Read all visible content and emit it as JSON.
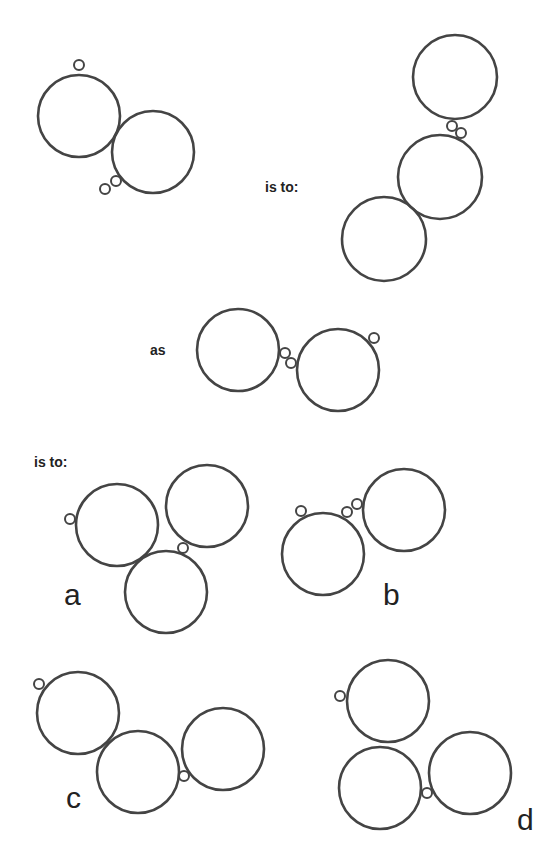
{
  "puzzle": {
    "stroke_color": "#444444",
    "background": "#ffffff",
    "labels": {
      "is_to_1": "is to:",
      "as": "as",
      "is_to_2": "is to:"
    },
    "figures": [
      {
        "id": "figure-1",
        "big": [
          {
            "cx": 79,
            "cy": 116,
            "r": 41
          },
          {
            "cx": 153,
            "cy": 152,
            "r": 41
          }
        ],
        "small": [
          {
            "cx": 79,
            "cy": 65,
            "r": 5
          },
          {
            "cx": 105,
            "cy": 189,
            "r": 5
          },
          {
            "cx": 116,
            "cy": 181,
            "r": 5
          }
        ]
      },
      {
        "id": "figure-2",
        "big": [
          {
            "cx": 455,
            "cy": 77,
            "r": 42
          },
          {
            "cx": 440,
            "cy": 177,
            "r": 42
          },
          {
            "cx": 384,
            "cy": 239,
            "r": 42
          }
        ],
        "small": [
          {
            "cx": 452,
            "cy": 126,
            "r": 5
          },
          {
            "cx": 461,
            "cy": 133,
            "r": 5
          }
        ]
      },
      {
        "id": "figure-3",
        "big": [
          {
            "cx": 238,
            "cy": 350,
            "r": 41
          },
          {
            "cx": 338,
            "cy": 370,
            "r": 41
          }
        ],
        "small": [
          {
            "cx": 285,
            "cy": 353,
            "r": 5
          },
          {
            "cx": 291,
            "cy": 363,
            "r": 5
          },
          {
            "cx": 374,
            "cy": 338,
            "r": 5
          }
        ]
      }
    ],
    "options": [
      {
        "label": "a",
        "label_pos": {
          "x": 64,
          "y": 605
        },
        "big": [
          {
            "cx": 117,
            "cy": 525,
            "r": 41
          },
          {
            "cx": 207,
            "cy": 506,
            "r": 41
          },
          {
            "cx": 166,
            "cy": 592,
            "r": 41
          }
        ],
        "small": [
          {
            "cx": 70,
            "cy": 519,
            "r": 5
          },
          {
            "cx": 183,
            "cy": 548,
            "r": 5
          }
        ]
      },
      {
        "label": "b",
        "label_pos": {
          "x": 383,
          "y": 605
        },
        "big": [
          {
            "cx": 323,
            "cy": 554,
            "r": 41
          },
          {
            "cx": 404,
            "cy": 510,
            "r": 41
          }
        ],
        "small": [
          {
            "cx": 301,
            "cy": 511,
            "r": 5
          },
          {
            "cx": 347,
            "cy": 512,
            "r": 5
          },
          {
            "cx": 357,
            "cy": 504,
            "r": 5
          }
        ]
      },
      {
        "label": "c",
        "label_pos": {
          "x": 66,
          "y": 808
        },
        "big": [
          {
            "cx": 78,
            "cy": 713,
            "r": 41
          },
          {
            "cx": 138,
            "cy": 772,
            "r": 41
          },
          {
            "cx": 223,
            "cy": 749,
            "r": 41
          }
        ],
        "small": [
          {
            "cx": 39,
            "cy": 684,
            "r": 5
          },
          {
            "cx": 184,
            "cy": 776,
            "r": 5
          }
        ]
      },
      {
        "label": "d",
        "label_pos": {
          "x": 517,
          "y": 830
        },
        "big": [
          {
            "cx": 388,
            "cy": 701,
            "r": 41
          },
          {
            "cx": 380,
            "cy": 788,
            "r": 41
          },
          {
            "cx": 470,
            "cy": 773,
            "r": 41
          }
        ],
        "small": [
          {
            "cx": 340,
            "cy": 696,
            "r": 5
          },
          {
            "cx": 427,
            "cy": 793,
            "r": 5
          }
        ]
      }
    ]
  }
}
